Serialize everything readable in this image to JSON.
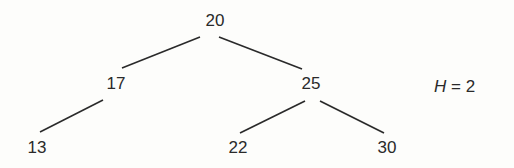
{
  "tree": {
    "nodes": [
      {
        "id": "n20",
        "value": "20",
        "x": 215,
        "y": 20
      },
      {
        "id": "n17",
        "value": "17",
        "x": 116,
        "y": 83
      },
      {
        "id": "n25",
        "value": "25",
        "x": 311,
        "y": 83
      },
      {
        "id": "n13",
        "value": "13",
        "x": 37,
        "y": 147
      },
      {
        "id": "n22",
        "value": "22",
        "x": 238,
        "y": 147
      },
      {
        "id": "n30",
        "value": "30",
        "x": 387,
        "y": 147
      }
    ],
    "edges": [
      {
        "from": "20",
        "to": "17"
      },
      {
        "from": "20",
        "to": "25"
      },
      {
        "from": "17",
        "to": "13"
      },
      {
        "from": "25",
        "to": "22"
      },
      {
        "from": "25",
        "to": "30"
      }
    ]
  },
  "height_annotation": {
    "variable": "H",
    "equals": " = ",
    "value": "2"
  },
  "colors": {
    "line": "#2a2a2a",
    "text": "#2a2a2a",
    "background": "#fdfdfb"
  }
}
